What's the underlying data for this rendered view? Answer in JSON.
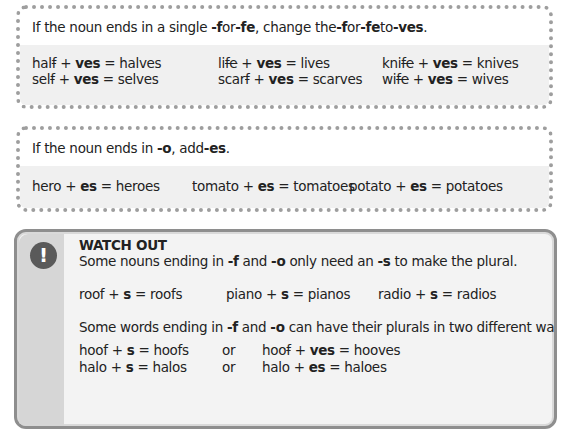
{
  "box_f": {
    "rule": {
      "p1": "If the noun ends in a single ",
      "b1": "-f",
      "p2": " or ",
      "b2": "-fe",
      "p3": ", change the ",
      "b3": "-f",
      "p4": " or ",
      "b4": "-fe",
      "p5": " to ",
      "b5": "-ves",
      "p6": "."
    },
    "examples": [
      [
        {
          "stem": "hal",
          "struck": "f",
          "suffix": "ves",
          "result": "halves"
        },
        {
          "stem": "li",
          "struck": "fe",
          "suffix": "ves",
          "result": "lives"
        },
        {
          "stem": "kni",
          "struck": "fe",
          "suffix": "ves",
          "result": "knives"
        }
      ],
      [
        {
          "stem": "sel",
          "struck": "f",
          "suffix": "ves",
          "result": "selves"
        },
        {
          "stem": "scar",
          "struck": "f",
          "suffix": "ves",
          "result": "scarves"
        },
        {
          "stem": "wi",
          "struck": "fe",
          "suffix": "ves",
          "result": "wives"
        }
      ]
    ]
  },
  "box_o": {
    "rule": {
      "p1": "If the noun ends in ",
      "b1": "-o",
      "p2": ", add ",
      "b2": "-es",
      "p3": "."
    },
    "examples": [
      {
        "word": "hero",
        "suffix": "es",
        "result": "heroes"
      },
      {
        "word": "tomato",
        "suffix": "es",
        "result": "tomatoes"
      },
      {
        "word": "potato",
        "suffix": "es",
        "result": "potatoes"
      }
    ]
  },
  "watch_out": {
    "icon": "exclamation-icon",
    "icon_glyph": "!",
    "title": "WATCH OUT",
    "line1": {
      "p1": "Some nouns ending in ",
      "b1": "-f",
      "p2": " and ",
      "b2": "-o",
      "p3": " only need an ",
      "b3": "-s",
      "p4": " to make the plural."
    },
    "examples1": [
      {
        "word": "roof",
        "suffix": "s",
        "result": "roofs"
      },
      {
        "word": "piano",
        "suffix": "s",
        "result": "pianos"
      },
      {
        "word": "radio",
        "suffix": "s",
        "result": "radios"
      }
    ],
    "line2": {
      "p1": "Some words ending in ",
      "b1": "-f",
      "p2": " and ",
      "b2": "-o",
      "p3": " can have their plurals in two different ways."
    },
    "examples2": [
      {
        "a_word": "hoof",
        "a_suffix": "s",
        "a_result": "hoofs",
        "or": "or",
        "b_stem": "hoo",
        "b_struck": "f",
        "b_suffix": "ves",
        "b_result": "hooves"
      },
      {
        "a_word": "halo",
        "a_suffix": "s",
        "a_result": "halos",
        "or": "or",
        "b_stem": "halo",
        "b_struck": "",
        "b_suffix": "es",
        "b_result": "haloes"
      }
    ]
  },
  "colors": {
    "dotted_border": "#9e9e9e",
    "band_bg": "#f0f0f0",
    "watch_border": "#8e8e8e",
    "watch_bg": "#f3f3f3",
    "watch_strip": "#d6d6d6",
    "icon_bg": "#5a5a5a"
  }
}
